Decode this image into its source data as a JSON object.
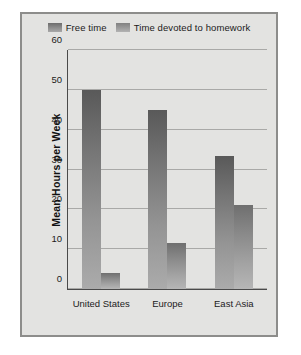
{
  "chart_data": {
    "type": "bar",
    "title": "",
    "xlabel": "",
    "ylabel": "Mean Hours per Week",
    "categories": [
      "United States",
      "Europe",
      "East Asia"
    ],
    "series": [
      {
        "name": "Free time",
        "values": [
          50,
          45,
          33.5
        ]
      },
      {
        "name": "Time devoted to homework",
        "values": [
          4,
          11.5,
          21
        ]
      }
    ],
    "ylim": [
      0,
      60
    ],
    "yticks": [
      0,
      10,
      20,
      30,
      40,
      50,
      60
    ],
    "grid": true,
    "legend_position": "top",
    "colors": {
      "free_time": "#757575",
      "homework": "#8a8a8a",
      "background": "#e3e3e1",
      "frame": "#8d8d8b",
      "axis": "#4a4a4a",
      "gridline": "#a9a9a7"
    }
  }
}
